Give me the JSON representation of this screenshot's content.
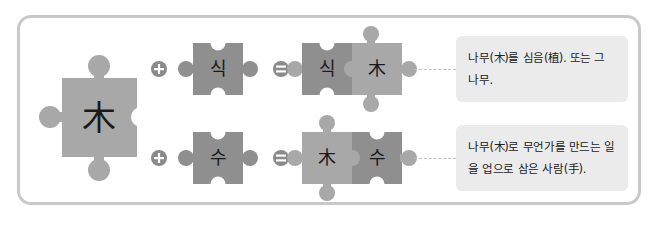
{
  "colors": {
    "frame_border": "#c9c9c9",
    "piece_light": "#a8a8a8",
    "piece_dark": "#8f8f8f",
    "operator": "#8a8a8a",
    "desc_bg": "#ebebeb"
  },
  "base_piece": {
    "char": "木"
  },
  "operators": {
    "plus": "plus-icon",
    "equals": "equals-icon"
  },
  "rows": [
    {
      "add_piece": "식",
      "result_left": "식",
      "result_right": "木",
      "description": "나무(木)를 심음(植). 또는 그 나무."
    },
    {
      "add_piece": "수",
      "result_left": "木",
      "result_right": "수",
      "description": "나무(木)로 무언가를 만드는 일을 업으로 삼은 사람(手)."
    }
  ]
}
